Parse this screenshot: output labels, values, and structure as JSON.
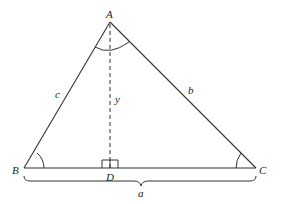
{
  "diagram": {
    "vertices": {
      "A": {
        "label": "A",
        "x": 110,
        "y": 22
      },
      "B": {
        "label": "B",
        "x": 24,
        "y": 168
      },
      "C": {
        "label": "C",
        "x": 256,
        "y": 168
      },
      "D": {
        "label": "D",
        "x": 110,
        "y": 168
      }
    },
    "sides": {
      "a": {
        "label": "a"
      },
      "b": {
        "label": "b"
      },
      "c": {
        "label": "c"
      }
    },
    "altitude": {
      "label": "y",
      "from": "A",
      "to": "D",
      "style": "dashed"
    },
    "right_angle_at": "D",
    "angle_marks": [
      "A",
      "B",
      "C"
    ],
    "stroke_color": "#333333"
  }
}
